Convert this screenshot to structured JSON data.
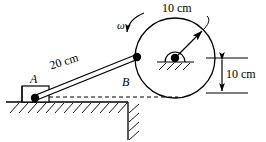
{
  "figure": {
    "background_color": "#ffffff",
    "stroke_color": "#000000",
    "width": 266,
    "height": 142
  },
  "labels": {
    "disk_radius": "10 cm",
    "center_height": "10 cm",
    "rod_length": "20 cm",
    "point_a": "A",
    "point_b": "B",
    "angular_velocity": "ω"
  },
  "geometry": {
    "disk": {
      "center_x": 175,
      "center_y": 58,
      "radius": 40
    },
    "pin_b": {
      "x": 137,
      "y": 57
    },
    "slider_a": {
      "x": 35,
      "y": 98
    },
    "ground_line_y": 102,
    "wall_x": 128,
    "dimension_top_y": 58,
    "dimension_bottom_y": 93,
    "dimension_x": 238
  },
  "annotations": {
    "radius_arrow": "radius-dimension-arrow",
    "height_arrow": "height-dimension-arrow",
    "rotation_arrow": "angular-velocity-arrow",
    "dashed_reference": "horizontal-reference-line"
  }
}
